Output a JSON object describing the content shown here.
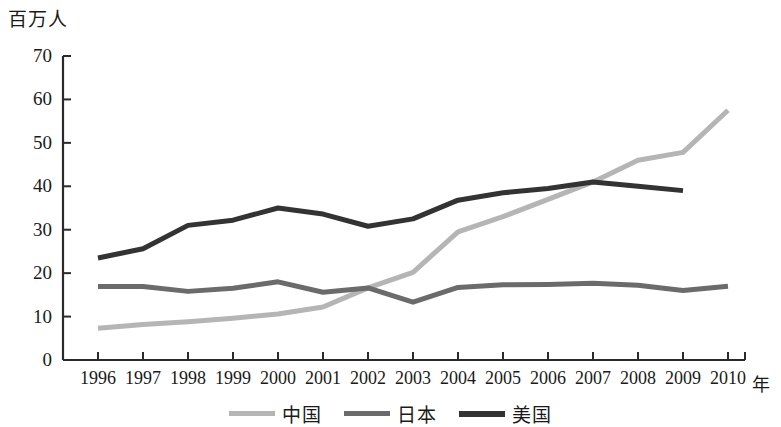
{
  "chart_data": {
    "type": "line",
    "title": "",
    "subtitle": "",
    "ylabel": "百万人",
    "xlabel": "年",
    "grid": false,
    "legend_position": "bottom",
    "categories": [
      "1996",
      "1997",
      "1998",
      "1999",
      "2000",
      "2001",
      "2002",
      "2003",
      "2004",
      "2005",
      "2006",
      "2007",
      "2008",
      "2009",
      "2010"
    ],
    "x": [
      1996,
      1997,
      1998,
      1999,
      2000,
      2001,
      2002,
      2003,
      2004,
      2005,
      2006,
      2007,
      2008,
      2009,
      2010
    ],
    "xlim": [
      1996,
      2010
    ],
    "ylim": [
      0,
      70
    ],
    "yticks": [
      0,
      10,
      20,
      30,
      40,
      50,
      60,
      70
    ],
    "series": [
      {
        "name": "中国",
        "color": "#b5b5b5",
        "width": 5,
        "values": [
          7.3,
          8.2,
          8.8,
          9.6,
          10.6,
          12.2,
          16.6,
          20.2,
          29.5,
          33.0,
          37.0,
          41.0,
          46.0,
          47.8,
          57.5
        ]
      },
      {
        "name": "日本",
        "color": "#6b6b6b",
        "width": 5,
        "values": [
          16.9,
          16.9,
          15.8,
          16.5,
          18.0,
          15.6,
          16.6,
          13.3,
          16.7,
          17.3,
          17.4,
          17.7,
          17.2,
          16.0,
          17.0
        ]
      },
      {
        "name": "美国",
        "color": "#333333",
        "width": 5,
        "values": [
          23.5,
          25.6,
          31.0,
          32.2,
          35.0,
          33.6,
          30.8,
          32.5,
          36.8,
          38.5,
          39.5,
          41.0,
          40.0,
          39.0,
          null
        ]
      }
    ],
    "legend": [
      {
        "label": "中国",
        "color": "#b5b5b5"
      },
      {
        "label": "日本",
        "color": "#6b6b6b"
      },
      {
        "label": "美国",
        "color": "#333333"
      }
    ],
    "axis_color": "#2a2a2a"
  }
}
